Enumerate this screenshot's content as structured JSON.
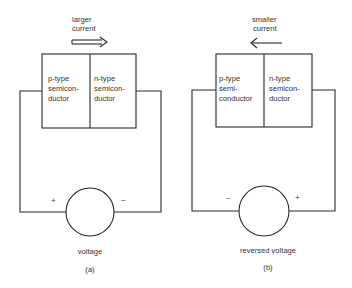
{
  "panels": [
    {
      "id": "a",
      "caption": "(a)",
      "current_label_line1": "larger",
      "current_label_line2": "current",
      "current_direction": "right",
      "p_region": {
        "line1": "p-type",
        "line2": "semicon-",
        "line3": "ductor"
      },
      "n_region": {
        "line1": "n-type",
        "line2": "semicon-",
        "line3": "ductor"
      },
      "source_label": "voltage",
      "left_terminal": "+",
      "right_terminal": "–"
    },
    {
      "id": "b",
      "caption": "(b)",
      "current_label_line1": "smaller",
      "current_label_line2": "current",
      "current_direction": "left",
      "p_region": {
        "line1": "p-type",
        "line2": "semi-",
        "line3": "conductor"
      },
      "n_region": {
        "line1": "n-type",
        "line2": "semicon-",
        "line3": "ductor"
      },
      "source_label": "reversed voltage",
      "left_terminal": "–",
      "right_terminal": "+"
    }
  ],
  "colors": {
    "line": "#2a2a2a",
    "text": "#333333",
    "background": "#ffffff"
  }
}
